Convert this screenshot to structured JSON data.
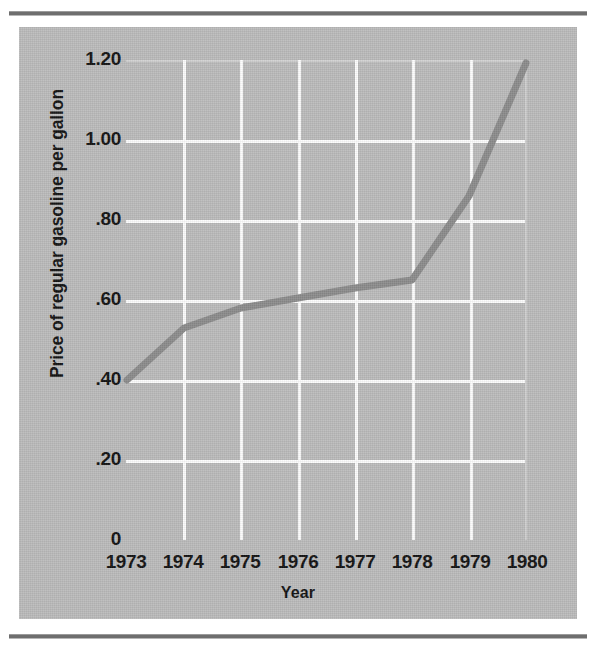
{
  "figure": {
    "background_color": "#bcbcbc",
    "rule_color": "#6e6e6e",
    "line_color": "#8c8c8c",
    "grid_color": "#fdfdfd",
    "text_color": "#131313"
  },
  "chart_data": {
    "type": "line",
    "title": "",
    "xlabel": "Year",
    "ylabel": "Price of regular gasoline per gallon",
    "categories": [
      "1973",
      "1974",
      "1975",
      "1976",
      "1977",
      "1978",
      "1979",
      "1980"
    ],
    "values": [
      0.4,
      0.53,
      0.58,
      0.605,
      0.63,
      0.65,
      0.86,
      1.2
    ],
    "series": [
      {
        "name": "Price of regular gasoline per gallon",
        "values": [
          0.4,
          0.53,
          0.58,
          0.605,
          0.63,
          0.65,
          0.86,
          1.2
        ]
      }
    ],
    "x_tick_labels": [
      "1973",
      "1974",
      "1975",
      "1976",
      "1977",
      "1978",
      "1979",
      "1980"
    ],
    "y_tick_labels": [
      "0",
      ".20",
      ".40",
      ".60",
      ".80",
      "1.00",
      "1.20"
    ],
    "y_tick_values": [
      0,
      0.2,
      0.4,
      0.6,
      0.8,
      1.0,
      1.2
    ],
    "ylim": [
      0,
      1.2
    ],
    "xlim": [
      "1973",
      "1980"
    ],
    "grid": "both",
    "legend": "none",
    "series_color": "#8c8c8c",
    "line_width_px": 7
  }
}
